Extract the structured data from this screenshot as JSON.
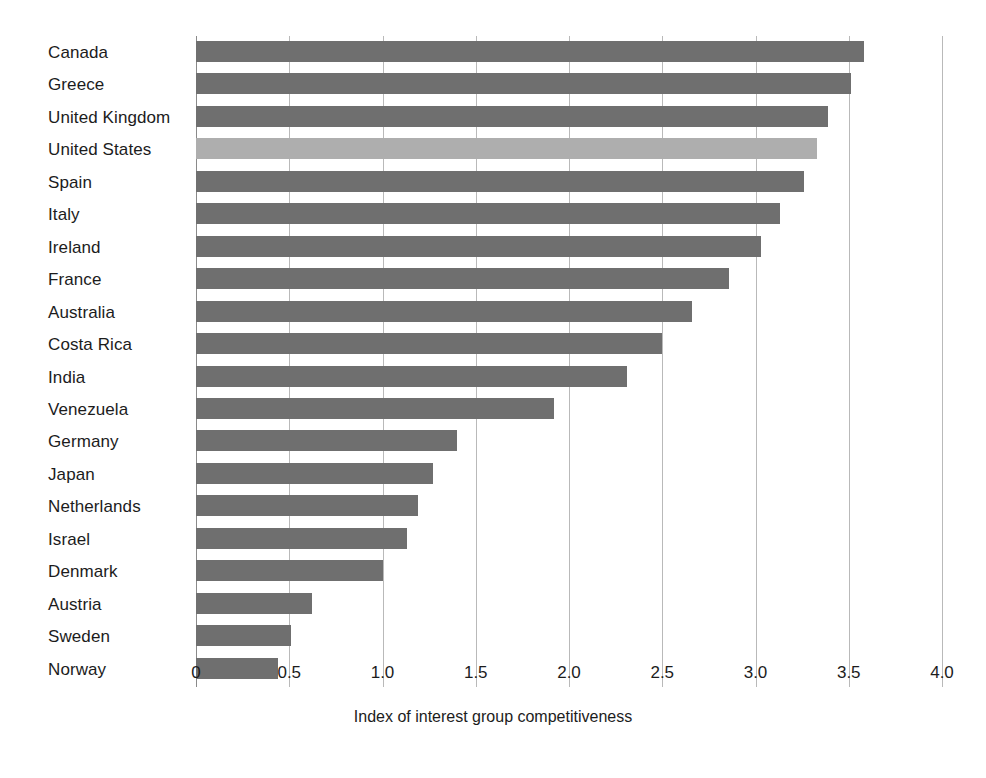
{
  "chart_data": {
    "type": "bar",
    "orientation": "horizontal",
    "title": "",
    "xlabel": "Index of interest group competitiveness",
    "ylabel": "",
    "xlim": [
      0,
      4.0
    ],
    "xticks": [
      "0",
      "0.5",
      "1.0",
      "1.5",
      "2.0",
      "2.5",
      "3.0",
      "3.5",
      "4.0"
    ],
    "xtick_values": [
      0,
      0.5,
      1.0,
      1.5,
      2.0,
      2.5,
      3.0,
      3.5,
      4.0
    ],
    "grid": "vertical",
    "legend": "none",
    "categories": [
      "Canada",
      "Greece",
      "United Kingdom",
      "United States",
      "Spain",
      "Italy",
      "Ireland",
      "France",
      "Australia",
      "Costa Rica",
      "India",
      "Venezuela",
      "Germany",
      "Japan",
      "Netherlands",
      "Israel",
      "Denmark",
      "Austria",
      "Sweden",
      "Norway"
    ],
    "values": [
      3.58,
      3.51,
      3.39,
      3.33,
      3.26,
      3.13,
      3.03,
      2.86,
      2.66,
      2.5,
      2.31,
      1.92,
      1.4,
      1.27,
      1.19,
      1.13,
      1.0,
      0.62,
      0.51,
      0.44
    ],
    "highlight_category": "United States",
    "colors": {
      "bar": "#6f6f6f",
      "highlight": "#aeaeae",
      "gridline": "#b9b9b9",
      "axis": "#8a8a8a",
      "text": "#1c1c1c",
      "background": "#ffffff"
    }
  }
}
